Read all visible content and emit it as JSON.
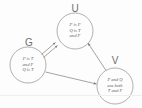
{
  "diagram": {
    "type": "directed-graph",
    "background_color": "#fdfdfd",
    "stroke_color": "#8a8a8a",
    "text_color": "#5a5a5a",
    "label_color": "#6d6d6d",
    "nodes": [
      {
        "id": "G",
        "label": "G",
        "label_x": 29,
        "label_y": 38,
        "cx": 28,
        "cy": 65,
        "r": 18,
        "lines": [
          "P is T",
          "and F",
          "Q is T"
        ],
        "text_x": 28,
        "text_y": 56
      },
      {
        "id": "U",
        "label": "U",
        "label_x": 74,
        "label_y": 4,
        "cx": 75,
        "cy": 31,
        "r": 18,
        "lines": [
          "P is F",
          "Q is T",
          "and F"
        ],
        "text_x": 75,
        "text_y": 22
      },
      {
        "id": "V",
        "label": "V",
        "label_x": 115,
        "label_y": 56,
        "cx": 115,
        "cy": 86,
        "r": 18,
        "lines": [
          "P and Q",
          "are both",
          "T and F"
        ],
        "text_x": 115,
        "text_y": 77
      }
    ],
    "edges": [
      {
        "id": "g-u-upper",
        "from": "G",
        "to": "U",
        "direction": "to-u"
      },
      {
        "id": "g-u-lower",
        "from": "U",
        "to": "G",
        "direction": "to-u-second"
      },
      {
        "id": "g-v",
        "from": "G",
        "to": "V",
        "direction": "forward"
      },
      {
        "id": "v-u",
        "from": "V",
        "to": "U",
        "direction": "forward"
      }
    ]
  }
}
